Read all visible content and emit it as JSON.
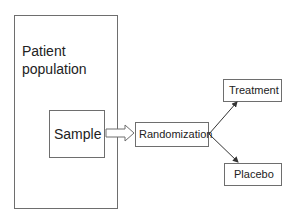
{
  "diagram": {
    "nodes": [
      {
        "id": "population",
        "label_line1": "Patient",
        "label_line2": "population"
      },
      {
        "id": "sample",
        "label": "Sample"
      },
      {
        "id": "randomization",
        "label": "Randomization"
      },
      {
        "id": "treatment",
        "label": "Treatment"
      },
      {
        "id": "placebo",
        "label": "Placebo"
      }
    ],
    "edges": [
      {
        "from": "sample",
        "to": "randomization",
        "style": "block-arrow"
      },
      {
        "from": "randomization",
        "to": "treatment",
        "style": "line-arrow"
      },
      {
        "from": "randomization",
        "to": "placebo",
        "style": "line-arrow"
      }
    ]
  }
}
